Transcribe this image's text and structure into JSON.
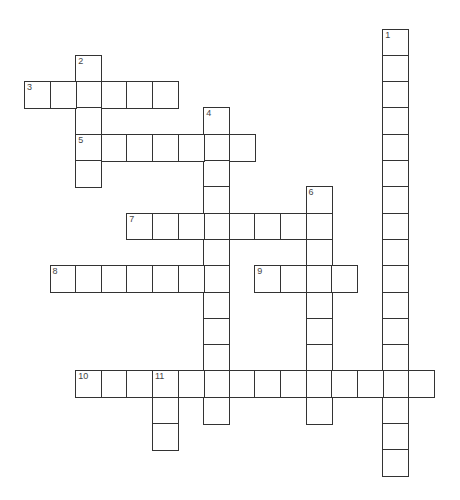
{
  "puzzle": {
    "type": "crossword",
    "cell_width": 25.6,
    "cell_height": 26.3,
    "origin_x": 24.7,
    "origin_y": 29.3,
    "colors": {
      "border": "#333333",
      "cell_bg": "#ffffff",
      "number": "#444444"
    },
    "words": [
      {
        "number": "1",
        "direction": "down",
        "row": 0,
        "col": 14,
        "length": 17
      },
      {
        "number": "2",
        "direction": "down",
        "row": 1,
        "col": 2,
        "length": 5
      },
      {
        "number": "3",
        "direction": "across",
        "row": 2,
        "col": 0,
        "length": 6
      },
      {
        "number": "4",
        "direction": "down",
        "row": 3,
        "col": 7,
        "length": 12
      },
      {
        "number": "5",
        "direction": "across",
        "row": 4,
        "col": 2,
        "length": 7
      },
      {
        "number": "6",
        "direction": "down",
        "row": 6,
        "col": 11,
        "length": 9
      },
      {
        "number": "7",
        "direction": "across",
        "row": 7,
        "col": 4,
        "length": 8
      },
      {
        "number": "8",
        "direction": "across",
        "row": 9,
        "col": 1,
        "length": 7
      },
      {
        "number": "9",
        "direction": "across",
        "row": 9,
        "col": 9,
        "length": 4
      },
      {
        "number": "10",
        "direction": "across",
        "row": 13,
        "col": 2,
        "length": 14
      },
      {
        "number": "11",
        "direction": "down",
        "row": 13,
        "col": 5,
        "length": 3
      }
    ]
  }
}
